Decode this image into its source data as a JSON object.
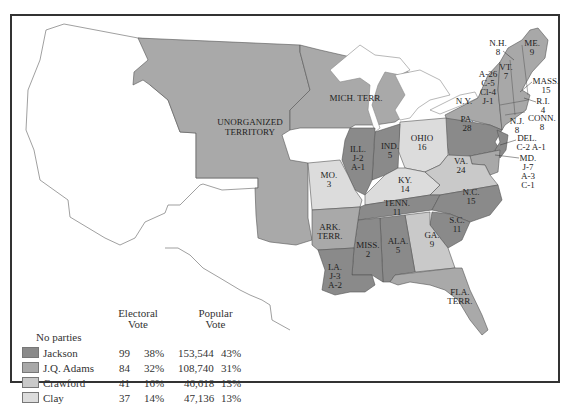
{
  "map": {
    "title": "Election of 1824",
    "colors": {
      "jackson": "#8a8a8a",
      "adams": "#a8a8a8",
      "crawford": "#c9c9c9",
      "clay": "#dcdcdc",
      "territory": "#a9a9a9",
      "water": "#ffffff",
      "border": "#555555"
    },
    "region_labels": {
      "unorganized_1": "UNORGANIZED",
      "unorganized_2": "TERRITORY",
      "mich": "MICH. TERR.",
      "ill_1": "ILL.",
      "ill_2": "J-2",
      "ill_3": "A-1",
      "ind_1": "IND.",
      "ind_2": "5",
      "ohio_1": "OHIO",
      "ohio_2": "16",
      "mo_1": "MO.",
      "mo_2": "3",
      "ky_1": "KY.",
      "ky_2": "14",
      "tenn_1": "TENN.",
      "tenn_2": "11",
      "ark_1": "ARK.",
      "ark_2": "TERR.",
      "la_1": "LA.",
      "la_2": "J-3",
      "la_3": "A-2",
      "miss_1": "MISS.",
      "miss_2": "2",
      "ala_1": "ALA.",
      "ala_2": "5",
      "ga_1": "GA.",
      "ga_2": "9",
      "sc_1": "S.C.",
      "sc_2": "11",
      "nc_1": "N.C.",
      "nc_2": "15",
      "va_1": "VA.",
      "va_2": "24",
      "pa_1": "PA.",
      "pa_2": "28",
      "ny_1": "N.Y.",
      "ny_a": "A-26",
      "ny_c": "C-5",
      "ny_cl": "Cl-4",
      "ny_j": "J-1",
      "vt_1": "VT.",
      "vt_2": "7",
      "nh_1": "N.H.",
      "nh_2": "8",
      "me_1": "ME.",
      "me_2": "9",
      "mass_1": "MASS.",
      "mass_2": "15",
      "ri_1": "R.I.",
      "ri_2": "4",
      "conn_1": "CONN.",
      "conn_2": "8",
      "nj_1": "N.J.",
      "nj_2": "8",
      "del_1": "DEL.",
      "del_2": "C-2  A-1",
      "md_1": "MD.",
      "md_2": "J-7",
      "md_3": "A-3",
      "md_4": "C-1",
      "fla_1": "FLA.",
      "fla_2": "TERR."
    }
  },
  "legend": {
    "party_header": "No parties",
    "electoral_header_1": "Electoral",
    "electoral_header_2": "Vote",
    "popular_header_1": "Popular",
    "popular_header_2": "Vote",
    "rows": [
      {
        "candidate": "Jackson",
        "electoral": "99",
        "electoral_pct": "38%",
        "popular": "153,544",
        "popular_pct": "43%",
        "color": "#8a8a8a"
      },
      {
        "candidate": "J.Q. Adams",
        "electoral": "84",
        "electoral_pct": "32%",
        "popular": "108,740",
        "popular_pct": "31%",
        "color": "#a8a8a8"
      },
      {
        "candidate": "Crawford",
        "electoral": "41",
        "electoral_pct": "16%",
        "popular": "46,618",
        "popular_pct": "13%",
        "color": "#c9c9c9"
      },
      {
        "candidate": "Clay",
        "electoral": "37",
        "electoral_pct": "14%",
        "popular": "47,136",
        "popular_pct": "13%",
        "color": "#dcdcdc"
      }
    ]
  }
}
